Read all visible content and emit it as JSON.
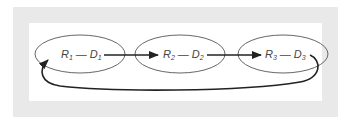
{
  "diagram": {
    "nodes": [
      {
        "id": "n1",
        "r": "R",
        "r_sub": "1",
        "d": "D",
        "d_sub": "1",
        "dash": "—"
      },
      {
        "id": "n2",
        "r": "R",
        "r_sub": "2",
        "d": "D",
        "d_sub": "2",
        "dash": "—"
      },
      {
        "id": "n3",
        "r": "R",
        "r_sub": "3",
        "d": "D",
        "d_sub": "3",
        "dash": "—"
      }
    ],
    "edges": [
      {
        "from": "n1",
        "to": "n2"
      },
      {
        "from": "n2",
        "to": "n3"
      },
      {
        "from": "n3",
        "to": "n1",
        "style": "feedback-loop"
      }
    ],
    "colors": {
      "frame": "#e9e9e9",
      "line": "#222222",
      "text": "#444444"
    }
  }
}
